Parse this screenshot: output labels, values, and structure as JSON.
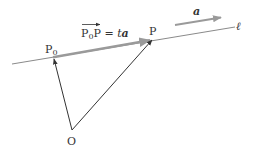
{
  "diagram": {
    "labels": {
      "origin": "O",
      "p0_base": "P",
      "p0_sub": "0",
      "p": "P",
      "line": "ℓ",
      "direction_vector": "a",
      "equation_lhs_base": "P",
      "equation_lhs_sub": "0",
      "equation_lhs_end": "P",
      "equation_rhs_t": "t",
      "equation_rhs_a": "a",
      "equation_equals": " = "
    },
    "colors": {
      "line": "#8a8a8a",
      "gray_vector": "#9a9a9a",
      "black_vector": "#333333",
      "text": "#333333"
    }
  }
}
